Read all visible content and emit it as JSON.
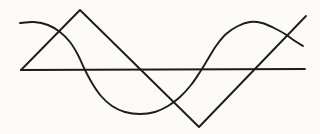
{
  "figure": {
    "background_color": "#fcfbf9",
    "ink_color": "#1c1c1c",
    "width": 320,
    "height": 134,
    "style": "scanned line drawing, no text labels"
  },
  "chart_data": {
    "type": "line",
    "title": "",
    "subtitle": "",
    "xlabel": "",
    "ylabel": "",
    "xlim": [
      20,
      306
    ],
    "ylim": [
      134,
      0
    ],
    "grid": false,
    "legend": "none",
    "tick_labels": {
      "x": [],
      "y": []
    },
    "annotations": [],
    "series": [
      {
        "name": "sine-wave",
        "type": "curve",
        "stroke": "#1c1c1c",
        "stroke_width": 1.9,
        "points": [
          [
            20,
            23
          ],
          [
            34,
            22
          ],
          [
            48,
            25
          ],
          [
            60,
            32
          ],
          [
            70,
            42
          ],
          [
            78,
            55
          ],
          [
            84,
            68
          ],
          [
            92,
            83
          ],
          [
            101,
            96
          ],
          [
            112,
            106
          ],
          [
            125,
            112
          ],
          [
            140,
            114
          ],
          [
            155,
            112
          ],
          [
            168,
            106
          ],
          [
            180,
            97
          ],
          [
            191,
            85
          ],
          [
            200,
            72
          ],
          [
            208,
            59
          ],
          [
            216,
            46
          ],
          [
            226,
            34
          ],
          [
            238,
            26
          ],
          [
            250,
            22
          ],
          [
            262,
            23
          ],
          [
            274,
            28
          ],
          [
            285,
            34
          ],
          [
            295,
            41
          ],
          [
            303,
            46
          ]
        ]
      },
      {
        "name": "triangle-wave",
        "type": "polyline",
        "stroke": "#1c1c1c",
        "stroke_width": 1.9,
        "points": [
          [
            21,
            70
          ],
          [
            80,
            10
          ],
          [
            199,
            127
          ],
          [
            306,
            16
          ]
        ]
      },
      {
        "name": "horizontal-axis-line",
        "type": "polyline",
        "stroke": "#1c1c1c",
        "stroke_width": 1.8,
        "points": [
          [
            21,
            70
          ],
          [
            305,
            69
          ]
        ]
      }
    ],
    "key_features": {
      "sine_left_start": [
        20,
        23
      ],
      "sine_trough": [
        140,
        114
      ],
      "sine_peak_right": [
        255,
        22
      ],
      "sine_right_end": [
        303,
        46
      ],
      "triangle_left_vertex": [
        21,
        70
      ],
      "triangle_apex": [
        80,
        10
      ],
      "triangle_bottom_vertex": [
        199,
        127
      ],
      "triangle_right_end": [
        306,
        16
      ],
      "axis_start": [
        21,
        70
      ],
      "axis_end": [
        305,
        69
      ]
    }
  }
}
